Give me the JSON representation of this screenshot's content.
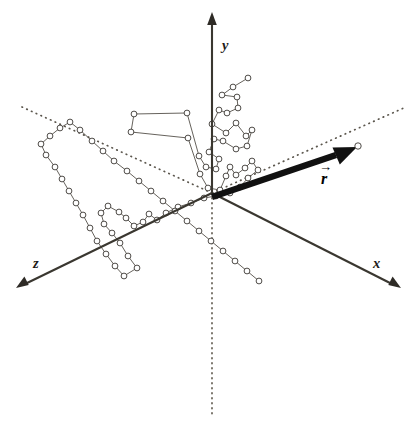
{
  "figure": {
    "background_color": "#ffffff",
    "width": 418,
    "height": 424
  },
  "axes": {
    "origin": {
      "x": 212,
      "y": 193
    },
    "line_color": "#3a3730",
    "items": [
      {
        "name": "y-axis",
        "label": "y",
        "label_pos": {
          "x": 222,
          "y": 50
        },
        "from": {
          "x": 212,
          "y": 193
        },
        "to": {
          "x": 212,
          "y": 16
        },
        "arrow": true
      },
      {
        "name": "x-axis",
        "label": "x",
        "label_pos": {
          "x": 373,
          "y": 268
        },
        "from": {
          "x": 212,
          "y": 193
        },
        "to": {
          "x": 398,
          "y": 287
        },
        "arrow": true
      },
      {
        "name": "z-axis",
        "label": "z",
        "label_pos": {
          "x": 36,
          "y": 268
        },
        "from": {
          "x": 212,
          "y": 193
        },
        "to": {
          "x": 18,
          "y": 287
        },
        "arrow": true
      }
    ]
  },
  "guides": {
    "color": "#5b564d",
    "negative_z_dotted": {
      "from": {
        "x": 212,
        "y": 193
      },
      "to": {
        "x": 22,
        "y": 107
      }
    },
    "negative_x_dotted": {
      "from": {
        "x": 212,
        "y": 193
      },
      "to": {
        "x": 406,
        "y": 107
      }
    },
    "negative_y_dotted": {
      "from": {
        "x": 212,
        "y": 193
      },
      "to": {
        "x": 212,
        "y": 418
      }
    }
  },
  "vector": {
    "name": "end-to-end-vector",
    "label": "r",
    "label_accent": "→",
    "label_pos": {
      "x": 322,
      "y": 180
    },
    "color": "#111111",
    "from": {
      "x": 212,
      "y": 196
    },
    "to": {
      "x": 356,
      "y": 147
    }
  },
  "chain": {
    "node_count": 86,
    "node_fill": "#ffffff",
    "node_stroke": "#3b3833",
    "node_radius": 2.9,
    "link_color": "#4a463f",
    "description": "Connected open-circle monomers forming a random coil about the origin",
    "nodes": [
      [
        248,
        78
      ],
      [
        233,
        87
      ],
      [
        222,
        95
      ],
      [
        237,
        97
      ],
      [
        238,
        108
      ],
      [
        227,
        113
      ],
      [
        219,
        110
      ],
      [
        212,
        124
      ],
      [
        226,
        133
      ],
      [
        236,
        123
      ],
      [
        246,
        136
      ],
      [
        252,
        130
      ],
      [
        247,
        146
      ],
      [
        236,
        149
      ],
      [
        223,
        141
      ],
      [
        214,
        139
      ],
      [
        209,
        152
      ],
      [
        219,
        159
      ],
      [
        216,
        169
      ],
      [
        206,
        167
      ],
      [
        199,
        156
      ],
      [
        187,
        113
      ],
      [
        134,
        114
      ],
      [
        131,
        132
      ],
      [
        188,
        138
      ],
      [
        200,
        174
      ],
      [
        208,
        188
      ],
      [
        220,
        190
      ],
      [
        226,
        176
      ],
      [
        230,
        167
      ],
      [
        236,
        175
      ],
      [
        245,
        168
      ],
      [
        252,
        161
      ],
      [
        258,
        170
      ],
      [
        248,
        178
      ],
      [
        240,
        187
      ],
      [
        230,
        193
      ],
      [
        216,
        196
      ],
      [
        204,
        198
      ],
      [
        191,
        203
      ],
      [
        178,
        207
      ],
      [
        166,
        213
      ],
      [
        157,
        220
      ],
      [
        149,
        214
      ],
      [
        143,
        222
      ],
      [
        134,
        226
      ],
      [
        126,
        218
      ],
      [
        119,
        212
      ],
      [
        108,
        206
      ],
      [
        101,
        213
      ],
      [
        104,
        224
      ],
      [
        112,
        233
      ],
      [
        120,
        243
      ],
      [
        128,
        256
      ],
      [
        137,
        268
      ],
      [
        124,
        276
      ],
      [
        115,
        266
      ],
      [
        106,
        254
      ],
      [
        97,
        241
      ],
      [
        90,
        228
      ],
      [
        83,
        215
      ],
      [
        76,
        203
      ],
      [
        69,
        191
      ],
      [
        62,
        179
      ],
      [
        55,
        167
      ],
      [
        46,
        155
      ],
      [
        41,
        144
      ],
      [
        50,
        136
      ],
      [
        60,
        128
      ],
      [
        70,
        122
      ],
      [
        80,
        130
      ],
      [
        92,
        141
      ],
      [
        103,
        151
      ],
      [
        114,
        161
      ],
      [
        127,
        171
      ],
      [
        139,
        181
      ],
      [
        151,
        191
      ],
      [
        163,
        201
      ],
      [
        175,
        211
      ],
      [
        187,
        221
      ],
      [
        199,
        231
      ],
      [
        211,
        241
      ],
      [
        223,
        251
      ],
      [
        235,
        261
      ],
      [
        247,
        271
      ],
      [
        259,
        281
      ]
    ],
    "links_note": "Sequential polyline through the nodes in the order listed"
  }
}
